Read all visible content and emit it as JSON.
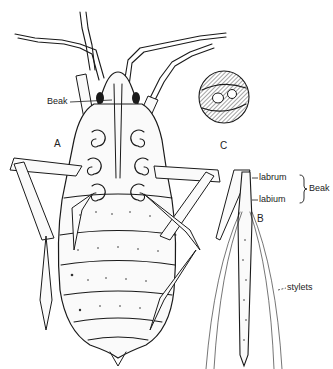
{
  "figure": {
    "panels": [
      {
        "id": "A",
        "label": "A",
        "description": "whole insect, ventral view"
      },
      {
        "id": "B",
        "label": "B",
        "description": "beak with stylets"
      },
      {
        "id": "C",
        "label": "C",
        "description": "cross-section of stylets"
      }
    ],
    "labels": {
      "beak_a": "Beak",
      "labrum": "labrum",
      "labium": "labium",
      "beak_b": "Beak",
      "stylets": "stylets"
    },
    "colors": {
      "ink": "#1a1a1a",
      "paper": "#ffffff"
    }
  }
}
